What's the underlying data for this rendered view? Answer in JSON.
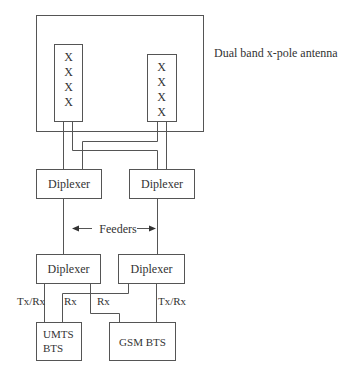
{
  "diagram": {
    "antenna": {
      "label": "Dual band x-pole antenna",
      "left_element": [
        "X",
        "X",
        "X",
        "X"
      ],
      "right_element": [
        "X",
        "X",
        "X",
        "X"
      ]
    },
    "top_diplexers": [
      {
        "label": "Diplexer"
      },
      {
        "label": "Diplexer"
      }
    ],
    "feeders_label": "Feeders",
    "bottom_diplexers": [
      {
        "label": "Diplexer"
      },
      {
        "label": "Diplexer"
      }
    ],
    "port_labels": {
      "left_txrx": "Tx/Rx",
      "left_rx": "Rx",
      "middle_rx": "Rx",
      "right_txrx": "Tx/Rx"
    },
    "bts": {
      "umts_line1": "UMTS",
      "umts_line2": "BTS",
      "gsm": "GSM BTS"
    },
    "colors": {
      "stroke": "#555555",
      "text": "#333333",
      "background": "#ffffff"
    }
  }
}
